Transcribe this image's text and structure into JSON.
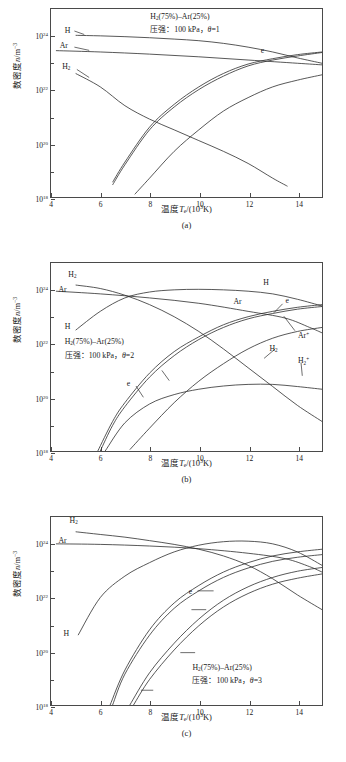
{
  "figure": {
    "axis": {
      "xlabel": "温度T_e/(10³K)",
      "ylabel": "数密度n/m⁻³",
      "xticks": [
        "4",
        "6",
        "8",
        "10",
        "12",
        "14"
      ],
      "yticks": [
        "10^24",
        "10^22",
        "10^20",
        "10^18"
      ],
      "xlim": [
        4,
        15
      ],
      "ylim_exp": [
        18,
        25
      ],
      "line_color": "#2b2b2b"
    },
    "panels": [
      {
        "id": "a",
        "caption": "(a)",
        "annotation_line1": "H₂(75%)–Ar(25%)",
        "annotation_line2": "压强：100 kPa，θ=1",
        "theta": "1",
        "labels": [
          {
            "name": "H",
            "text": "H"
          },
          {
            "name": "Ar",
            "text": "Ar"
          },
          {
            "name": "H2",
            "text": "H₂"
          },
          {
            "name": "Arp",
            "text": "Ar⁺"
          },
          {
            "name": "e",
            "text": "e"
          },
          {
            "name": "Hp",
            "text": "H⁺"
          }
        ]
      },
      {
        "id": "b",
        "caption": "(b)",
        "annotation_line1": "H₂(75%)–Ar(25%)",
        "annotation_line2": "压强：100 kPa，θ=2",
        "theta": "2",
        "labels": [
          {
            "name": "H2",
            "text": "H₂"
          },
          {
            "name": "Ar",
            "text": "Ar"
          },
          {
            "name": "H",
            "text": "H"
          },
          {
            "name": "Hright",
            "text": "H"
          },
          {
            "name": "Arright",
            "text": "Ar"
          },
          {
            "name": "e",
            "text": "e"
          },
          {
            "name": "eleft",
            "text": "e"
          },
          {
            "name": "Hp",
            "text": "H⁺"
          },
          {
            "name": "Arp",
            "text": "Ar⁺"
          },
          {
            "name": "ArpR",
            "text": "Ar⁺"
          },
          {
            "name": "H2r",
            "text": "H₂"
          },
          {
            "name": "H2p",
            "text": "H₂⁺"
          }
        ]
      },
      {
        "id": "c",
        "caption": "(c)",
        "annotation_line1": "H₂(75%)–Ar(25%)",
        "annotation_line2": "压强：100 kPa，θ=3",
        "theta": "3",
        "labels": [
          {
            "name": "H2",
            "text": "H₂"
          },
          {
            "name": "Ar",
            "text": "Ar"
          },
          {
            "name": "H",
            "text": "H"
          },
          {
            "name": "e",
            "text": "e"
          },
          {
            "name": "H2p",
            "text": "H₂⁺"
          },
          {
            "name": "Hp",
            "text": "H⁺"
          },
          {
            "name": "Arp",
            "text": "Ar⁺"
          }
        ]
      }
    ]
  },
  "chart_data": [
    {
      "type": "line",
      "panel": "a",
      "title": "H₂(75%)–Ar(25%), 压强：100 kPa, θ=1",
      "xlabel": "温度T_e/(10³K)",
      "ylabel": "数密度n/m⁻³",
      "xlim": [
        4,
        15
      ],
      "ylim": [
        1e+18,
        3e+25
      ],
      "yscale": "log",
      "grid": false,
      "legend": "inline-labels",
      "series": [
        {
          "name": "H",
          "x": [
            5,
            6,
            7,
            8,
            9,
            10,
            11,
            12,
            13,
            14,
            15
          ],
          "y_exp": [
            24.02,
            24.0,
            23.97,
            23.93,
            23.88,
            23.82,
            23.72,
            23.58,
            23.4,
            23.18,
            22.98
          ]
        },
        {
          "name": "Ar",
          "x": [
            4.2,
            6,
            8,
            10,
            12,
            14,
            15
          ],
          "y_exp": [
            23.45,
            23.4,
            23.32,
            23.22,
            23.1,
            22.98,
            22.92
          ]
        },
        {
          "name": "H2",
          "x": [
            5,
            6,
            7,
            8,
            9,
            10,
            11,
            12,
            13,
            13.6
          ],
          "y_exp": [
            22.6,
            22.1,
            21.4,
            20.9,
            20.5,
            20.1,
            19.7,
            19.25,
            18.7,
            18.4
          ]
        },
        {
          "name": "e",
          "x": [
            6.5,
            7,
            8,
            9,
            10,
            11,
            12,
            13,
            14,
            15
          ],
          "y_exp": [
            18.55,
            19.3,
            20.6,
            21.45,
            22.1,
            22.6,
            22.95,
            23.15,
            23.3,
            23.4
          ]
        },
        {
          "name": "H+",
          "x": [
            6.5,
            7,
            8,
            9,
            10,
            11,
            12,
            13,
            14,
            15
          ],
          "y_exp": [
            18.45,
            19.2,
            20.5,
            21.35,
            22.0,
            22.5,
            22.88,
            23.1,
            23.25,
            23.38
          ]
        },
        {
          "name": "Ar+",
          "x": [
            7.4,
            8,
            9,
            10,
            11,
            12,
            13,
            14,
            15
          ],
          "y_exp": [
            18.1,
            18.7,
            19.7,
            20.5,
            21.2,
            21.7,
            22.1,
            22.35,
            22.55
          ]
        }
      ]
    },
    {
      "type": "line",
      "panel": "b",
      "title": "H₂(75%)–Ar(25%), 压强：100 kPa, θ=2",
      "xlabel": "温度T_e/(10³K)",
      "ylabel": "数密度n/m⁻³",
      "xlim": [
        4,
        15
      ],
      "ylim": [
        1e+18,
        3e+25
      ],
      "yscale": "log",
      "grid": false,
      "legend": "inline-labels",
      "series": [
        {
          "name": "H2",
          "x": [
            5,
            6,
            7,
            8,
            9,
            10,
            11,
            12,
            13,
            14,
            15
          ],
          "y_exp": [
            24.18,
            24.05,
            23.8,
            23.45,
            23.0,
            22.45,
            21.8,
            21.1,
            20.4,
            19.7,
            19.1
          ]
        },
        {
          "name": "Ar",
          "x": [
            4.2,
            6,
            8,
            10,
            12,
            13.5,
            14.5,
            15
          ],
          "y_exp": [
            23.95,
            23.85,
            23.7,
            23.5,
            23.2,
            22.95,
            22.6,
            22.4
          ]
        },
        {
          "name": "H",
          "x": [
            5,
            6,
            7,
            8,
            9,
            10,
            11,
            12,
            13,
            14,
            15
          ],
          "y_exp": [
            22.5,
            23.2,
            23.7,
            23.92,
            24.0,
            24.02,
            24.0,
            23.95,
            23.85,
            23.65,
            23.4
          ]
        },
        {
          "name": "e",
          "x": [
            5.9,
            6.5,
            7,
            8,
            9,
            10,
            11,
            12,
            13,
            14,
            15
          ],
          "y_exp": [
            18.0,
            19.1,
            19.8,
            20.9,
            21.7,
            22.25,
            22.7,
            23.0,
            23.2,
            23.35,
            23.45
          ]
        },
        {
          "name": "H+",
          "x": [
            6.0,
            6.5,
            7,
            8,
            9,
            10,
            11,
            12,
            13,
            14,
            15
          ],
          "y_exp": [
            18.0,
            18.95,
            19.65,
            20.75,
            21.55,
            22.15,
            22.6,
            22.92,
            23.12,
            23.28,
            23.38
          ]
        },
        {
          "name": "Ar+",
          "x": [
            7.2,
            8,
            9,
            10,
            11,
            12,
            13,
            14,
            15
          ],
          "y_exp": [
            18.05,
            18.85,
            19.8,
            20.6,
            21.25,
            21.8,
            22.2,
            22.45,
            22.6
          ]
        },
        {
          "name": "H2+",
          "x": [
            6.2,
            7,
            8,
            9,
            10,
            11,
            12,
            13,
            14,
            15
          ],
          "y_exp": [
            18.0,
            19.05,
            19.75,
            20.1,
            20.3,
            20.42,
            20.48,
            20.48,
            20.4,
            20.3
          ]
        }
      ]
    },
    {
      "type": "line",
      "panel": "c",
      "title": "H₂(75%)–Ar(25%), 压强：100 kPa, θ=3",
      "xlabel": "温度T_e/(10³K)",
      "ylabel": "数密度n/m⁻³",
      "xlim": [
        4,
        15
      ],
      "ylim": [
        1e+18,
        3e+25
      ],
      "yscale": "log",
      "grid": false,
      "legend": "inline-labels",
      "series": [
        {
          "name": "H2",
          "x": [
            5,
            6,
            7,
            8,
            9,
            10,
            11,
            12,
            13,
            14,
            15
          ],
          "y_exp": [
            24.45,
            24.35,
            24.25,
            24.12,
            23.98,
            23.8,
            23.55,
            23.2,
            22.7,
            22.1,
            21.55
          ]
        },
        {
          "name": "Ar",
          "x": [
            4.2,
            6,
            8,
            10,
            12,
            13.5,
            14.5,
            15
          ],
          "y_exp": [
            24.0,
            23.98,
            23.92,
            23.82,
            23.65,
            23.45,
            23.15,
            22.95
          ]
        },
        {
          "name": "H",
          "x": [
            5.1,
            6,
            7,
            8,
            9,
            10,
            11,
            12,
            13,
            14,
            15
          ],
          "y_exp": [
            20.6,
            22.0,
            22.8,
            23.3,
            23.7,
            23.95,
            24.08,
            24.1,
            24.0,
            23.7,
            23.2
          ]
        },
        {
          "name": "e",
          "x": [
            6.4,
            7,
            8,
            9,
            10,
            11,
            12,
            13,
            14,
            15
          ],
          "y_exp": [
            18.0,
            19.3,
            20.8,
            21.8,
            22.45,
            22.95,
            23.3,
            23.55,
            23.7,
            23.8
          ]
        },
        {
          "name": "H2+",
          "x": [
            6.5,
            7,
            8,
            9,
            10,
            11,
            12,
            13,
            14,
            15
          ],
          "y_exp": [
            18.0,
            19.15,
            20.6,
            21.6,
            22.25,
            22.75,
            23.1,
            23.35,
            23.5,
            23.6
          ]
        },
        {
          "name": "H+",
          "x": [
            7.2,
            8,
            9,
            10,
            11,
            12,
            13,
            14,
            15
          ],
          "y_exp": [
            18.0,
            19.2,
            20.3,
            21.2,
            21.9,
            22.4,
            22.75,
            22.98,
            23.12
          ]
        },
        {
          "name": "Ar+",
          "x": [
            7.35,
            8,
            9,
            10,
            11,
            12,
            13,
            14,
            15
          ],
          "y_exp": [
            18.0,
            18.95,
            20.05,
            20.95,
            21.65,
            22.15,
            22.5,
            22.72,
            22.88
          ]
        }
      ]
    }
  ]
}
